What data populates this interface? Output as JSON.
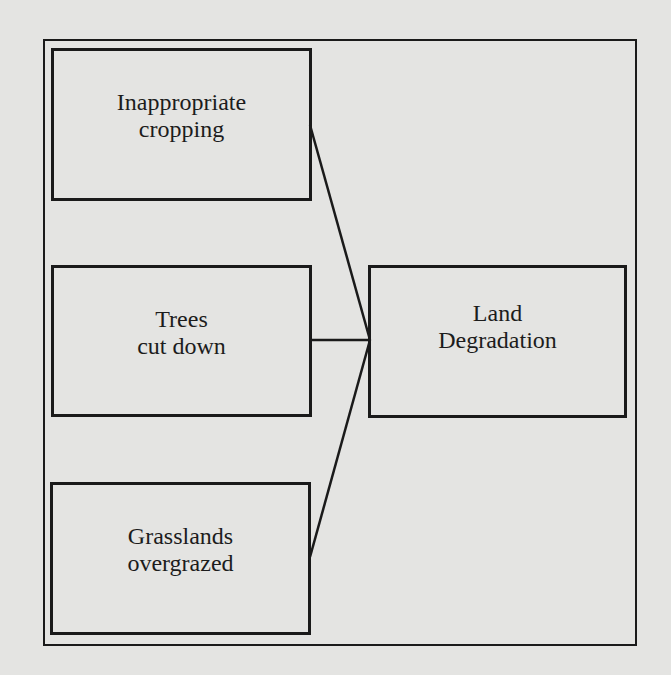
{
  "diagram": {
    "type": "cause-effect",
    "causes": [
      {
        "id": "cause-1",
        "lines": [
          "Inappropriate",
          "cropping"
        ]
      },
      {
        "id": "cause-2",
        "lines": [
          "Trees",
          "cut down"
        ]
      },
      {
        "id": "cause-3",
        "lines": [
          "Grasslands",
          "overgrazed"
        ]
      }
    ],
    "effect": {
      "id": "effect",
      "lines": [
        "Land",
        "Degradation"
      ]
    },
    "edges": [
      {
        "from": "cause-1",
        "to": "effect"
      },
      {
        "from": "cause-2",
        "to": "effect"
      },
      {
        "from": "cause-3",
        "to": "effect"
      }
    ],
    "colors": {
      "background": "#e4e4e2",
      "stroke": "#1a1a1a",
      "text": "#1c1c1c"
    }
  }
}
